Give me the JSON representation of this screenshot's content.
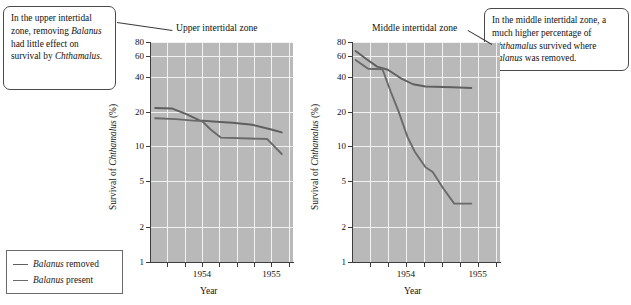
{
  "figure": {
    "callouts": [
      {
        "id": "upper",
        "text_runs": [
          {
            "t": "In the upper intertidal zone, removing ",
            "i": false
          },
          {
            "t": "Balanus",
            "i": true
          },
          {
            "t": " had little effect on survival by ",
            "i": false
          },
          {
            "t": "Chthamalus",
            "i": true
          },
          {
            "t": ".",
            "i": false
          }
        ],
        "plain": "In the upper intertidal zone, removing Balanus had little effect on survival by Chthamalus."
      },
      {
        "id": "middle",
        "text_runs": [
          {
            "t": "In the middle intertidal zone, a much higher percentage of ",
            "i": false
          },
          {
            "t": "Chthamalus",
            "i": true
          },
          {
            "t": " survived where ",
            "i": false
          },
          {
            "t": "Balanus",
            "i": true
          },
          {
            "t": " was removed.",
            "i": false
          }
        ],
        "plain": "In the middle intertidal zone, a much higher percentage of Chthamalus survived where Balanus was removed."
      }
    ],
    "legend": {
      "items": [
        {
          "label_italic": "Balanus",
          "label_rest": " removed",
          "color": "#5f5f5f"
        },
        {
          "label_italic": "Balanus",
          "label_rest": " present",
          "color": "#6a6a6a"
        }
      ]
    },
    "colors": {
      "plot_background": "#b9b9b9",
      "gridline": "#f2f2f2",
      "axis": "#3d3d3d",
      "line_removed": "#5f5f5f",
      "line_present": "#6a6a6a",
      "callout_border": "#4a4a4a"
    }
  },
  "chart_data": [
    {
      "type": "line",
      "id": "upper-intertidal",
      "title": "Upper intertidal zone",
      "xlabel": "Year",
      "ylabel": "Survival of Chthamalus (%)",
      "ylabel_italic_part": "Chthamalus",
      "yscale": "log",
      "ylim": [
        1,
        80
      ],
      "yticks": [
        1,
        2,
        5,
        10,
        20,
        40,
        60,
        80
      ],
      "ytick_labels": [
        "1",
        "2",
        "5",
        "10",
        "20",
        "40",
        "60",
        "80"
      ],
      "xlim": [
        1953.6,
        1955.25
      ],
      "xticks": [
        1953.8,
        1954.0,
        1954.2,
        1954.4,
        1954.6,
        1954.8,
        1955.0,
        1955.2
      ],
      "xtick_labels": [
        "",
        "",
        "1954",
        "",
        "",
        "",
        "1955",
        ""
      ],
      "grid": true,
      "series": [
        {
          "name": "Balanus removed",
          "color": "#5f5f5f",
          "points": [
            {
              "x": 1953.66,
              "y": 21.5
            },
            {
              "x": 1953.85,
              "y": 21.3
            },
            {
              "x": 1954.02,
              "y": 19.0
            },
            {
              "x": 1954.17,
              "y": 16.8
            },
            {
              "x": 1954.33,
              "y": 16.4
            },
            {
              "x": 1954.55,
              "y": 16.0
            },
            {
              "x": 1954.78,
              "y": 15.4
            },
            {
              "x": 1955.0,
              "y": 14.0
            },
            {
              "x": 1955.12,
              "y": 13.2
            }
          ]
        },
        {
          "name": "Balanus present",
          "color": "#6a6a6a",
          "points": [
            {
              "x": 1953.66,
              "y": 17.5
            },
            {
              "x": 1953.9,
              "y": 17.2
            },
            {
              "x": 1954.1,
              "y": 16.7
            },
            {
              "x": 1954.2,
              "y": 16.6
            },
            {
              "x": 1954.3,
              "y": 14.0
            },
            {
              "x": 1954.42,
              "y": 11.9
            },
            {
              "x": 1954.75,
              "y": 11.7
            },
            {
              "x": 1954.95,
              "y": 11.6
            },
            {
              "x": 1955.12,
              "y": 8.6
            }
          ]
        }
      ]
    },
    {
      "type": "line",
      "id": "middle-intertidal",
      "title": "Middle intertidal zone",
      "xlabel": "Year",
      "ylabel": "Survival of Chthamalus (%)",
      "ylabel_italic_part": "Chthamalus",
      "yscale": "log",
      "ylim": [
        1,
        80
      ],
      "yticks": [
        1,
        2,
        5,
        10,
        20,
        40,
        60,
        80
      ],
      "ytick_labels": [
        "1",
        "2",
        "5",
        "10",
        "20",
        "40",
        "60",
        "80"
      ],
      "xlim": [
        1953.6,
        1955.25
      ],
      "xticks": [
        1953.8,
        1954.0,
        1954.2,
        1954.4,
        1954.6,
        1954.8,
        1955.0,
        1955.2
      ],
      "xtick_labels": [
        "",
        "",
        "1954",
        "",
        "",
        "",
        "1955",
        ""
      ],
      "grid": true,
      "series": [
        {
          "name": "Balanus removed",
          "color": "#5f5f5f",
          "points": [
            {
              "x": 1953.64,
              "y": 67.0
            },
            {
              "x": 1953.76,
              "y": 57.0
            },
            {
              "x": 1953.88,
              "y": 49.0
            },
            {
              "x": 1954.0,
              "y": 46.0
            },
            {
              "x": 1954.14,
              "y": 39.0
            },
            {
              "x": 1954.28,
              "y": 34.5
            },
            {
              "x": 1954.42,
              "y": 33.0
            },
            {
              "x": 1954.72,
              "y": 32.5
            },
            {
              "x": 1954.93,
              "y": 32.0
            }
          ]
        },
        {
          "name": "Balanus present",
          "color": "#6a6a6a",
          "points": [
            {
              "x": 1953.64,
              "y": 56.0
            },
            {
              "x": 1953.78,
              "y": 47.0
            },
            {
              "x": 1953.94,
              "y": 46.5
            },
            {
              "x": 1954.03,
              "y": 30.0
            },
            {
              "x": 1954.12,
              "y": 20.0
            },
            {
              "x": 1954.22,
              "y": 12.0
            },
            {
              "x": 1954.3,
              "y": 9.0
            },
            {
              "x": 1954.42,
              "y": 6.6
            },
            {
              "x": 1954.5,
              "y": 6.0
            },
            {
              "x": 1954.62,
              "y": 4.3
            },
            {
              "x": 1954.74,
              "y": 3.2
            },
            {
              "x": 1954.93,
              "y": 3.2
            }
          ]
        }
      ]
    }
  ]
}
